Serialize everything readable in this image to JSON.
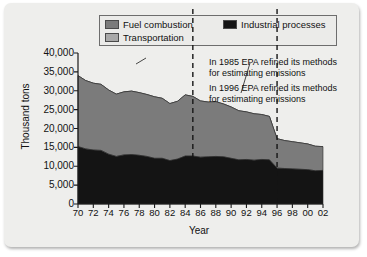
{
  "legend": {
    "items": [
      {
        "label": "Fuel combustion",
        "color": "#7b7b7b",
        "row": 1
      },
      {
        "label": "Transportation",
        "color": "#a8a8a8",
        "row": 2
      },
      {
        "label": "Industrial processes",
        "color": "#141414",
        "row": 3
      }
    ]
  },
  "annotations": [
    {
      "line1": "In 1985 EPA refined its methods",
      "line2": "for estimating emissions",
      "year": 1985
    },
    {
      "line1": "In 1996 EPA refined its methods",
      "line2": "for estimating emissions",
      "year": 1996
    }
  ],
  "chart_data": {
    "type": "area",
    "title": "",
    "xlabel": "Year",
    "ylabel": "Thousand tons",
    "ylim": [
      0,
      40000
    ],
    "yticks": [
      "0",
      "5,000",
      "10,000",
      "15,000",
      "20,000",
      "25,000",
      "30,000",
      "35,000",
      "40,000"
    ],
    "ytick_values": [
      0,
      5000,
      10000,
      15000,
      20000,
      25000,
      30000,
      35000,
      40000
    ],
    "xticks": [
      "70",
      "72",
      "74",
      "76",
      "78",
      "80",
      "82",
      "84",
      "86",
      "88",
      "90",
      "92",
      "94",
      "96",
      "98",
      "00",
      "02"
    ],
    "xtick_values": [
      1970,
      1972,
      1974,
      1976,
      1978,
      1980,
      1982,
      1984,
      1986,
      1988,
      1990,
      1992,
      1994,
      1996,
      1998,
      2000,
      2002
    ],
    "xlim": [
      1970,
      2002
    ],
    "grid": false,
    "legend_position": "top",
    "stacked": true,
    "x": [
      1970,
      1971,
      1972,
      1973,
      1974,
      1975,
      1976,
      1977,
      1978,
      1979,
      1980,
      1981,
      1982,
      1983,
      1984,
      1985,
      1986,
      1987,
      1988,
      1989,
      1990,
      1991,
      1992,
      1993,
      1994,
      1995,
      1996,
      1997,
      1998,
      1999,
      2000,
      2001,
      2002
    ],
    "series": [
      {
        "name": "Industrial processes",
        "color": "#141414",
        "values": [
          15200,
          14600,
          14300,
          14200,
          13200,
          12600,
          13000,
          13100,
          12900,
          12600,
          12100,
          12100,
          11500,
          11900,
          12700,
          12700,
          12400,
          12500,
          12600,
          12500,
          12100,
          11700,
          11800,
          11600,
          11800,
          11700,
          9500,
          9400,
          9300,
          9200,
          9100,
          8800,
          8900
        ]
      },
      {
        "name": "Fuel combustion",
        "color": "#7b7b7b",
        "values": [
          18800,
          18100,
          17700,
          17500,
          17000,
          16500,
          16700,
          16800,
          16600,
          16400,
          16300,
          15900,
          15100,
          15300,
          16200,
          15800,
          14900,
          14500,
          14500,
          14000,
          13600,
          13000,
          12600,
          12300,
          11900,
          11500,
          7800,
          7400,
          7200,
          7000,
          6800,
          6500,
          6300
        ]
      },
      {
        "name": "Transportation",
        "color": "#a8a8a8",
        "values": [
          0,
          0,
          0,
          0,
          0,
          0,
          0,
          0,
          0,
          0,
          0,
          0,
          0,
          0,
          0,
          0,
          0,
          0,
          0,
          0,
          0,
          0,
          0,
          0,
          0,
          0,
          0,
          0,
          0,
          0,
          0,
          0,
          0
        ]
      }
    ],
    "totals": [
      34000,
      32700,
      32000,
      31700,
      30200,
      29100,
      29700,
      29900,
      29500,
      29000,
      28400,
      28000,
      26600,
      27200,
      28900,
      28500,
      27300,
      27000,
      27100,
      26500,
      25700,
      24700,
      24400,
      23900,
      23700,
      23200,
      17300,
      16800,
      16500,
      16200,
      15900,
      15300,
      15200
    ]
  }
}
